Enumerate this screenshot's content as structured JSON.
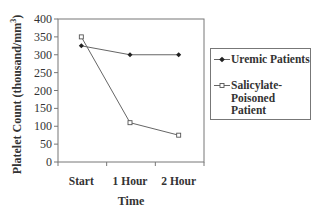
{
  "chart_data": {
    "type": "line",
    "title": "",
    "xlabel": "Time",
    "ylabel": "Platelet Count (thousand/mm³)",
    "ylabel_parts": {
      "main": "Platelet Count (thousand/mm",
      "sup": "3",
      "end": ")"
    },
    "categories": [
      "Start",
      "1 Hour",
      "2 Hour"
    ],
    "yticks": [
      0,
      50,
      100,
      150,
      200,
      250,
      300,
      350,
      400
    ],
    "ylim": [
      0,
      400
    ],
    "grid": false,
    "legend_position": "right",
    "series": [
      {
        "name": "Uremic Patients",
        "marker": "filled-diamond",
        "values": [
          325,
          300,
          300
        ]
      },
      {
        "name": "Salicylate-Poisoned Patient",
        "marker": "open-square",
        "values": [
          350,
          110,
          75
        ]
      }
    ]
  },
  "legend": {
    "items": [
      {
        "lines": [
          "Uremic Patients"
        ]
      },
      {
        "lines": [
          "Salicylate-",
          "Poisoned",
          "Patient"
        ]
      }
    ]
  },
  "colors": {
    "line": "#666666",
    "axis": "#777777",
    "text": "#333333"
  }
}
